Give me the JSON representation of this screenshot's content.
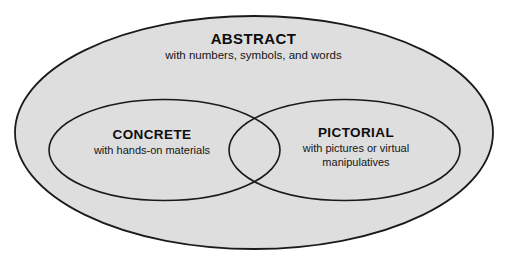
{
  "diagram": {
    "type": "venn",
    "title_text": "",
    "background_color": "#ffffff",
    "outer_fill_color": "#dedede",
    "stroke_color": "#1a1a1a",
    "text_color": "#111111",
    "sets": {
      "outer": {
        "name": "ABSTRACT",
        "title": "ABSTRACT",
        "subtitle": "with numbers, symbols, and words"
      },
      "left": {
        "name": "CONCRETE",
        "title": "CONCRETE",
        "subtitle": "with hands-on materials"
      },
      "right": {
        "name": "PICTORIAL",
        "title": "PICTORIAL",
        "subtitle_line1": "with pictures or virtual",
        "subtitle_line2": "manipulatives"
      }
    }
  }
}
